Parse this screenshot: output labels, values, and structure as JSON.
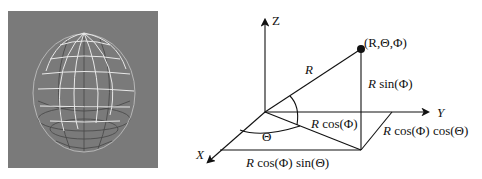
{
  "figure": {
    "left_panel": {
      "description": "wireframe sphere render on gray background",
      "background_color": "#7a7a7a",
      "latitude_lines": 7,
      "longitude_lines": 8
    },
    "right_panel": {
      "axes": {
        "z_label": "Z",
        "y_label": "Y",
        "x_label": "X"
      },
      "point_label": "(R,Θ,Φ)",
      "radius_label": "R",
      "height_label_r": "R",
      "height_label_rest": " sin(Φ)",
      "projection_label_r": "R",
      "projection_label_rest": " cos(Φ)",
      "y_component_label_r": "R",
      "y_component_label_rest": " cos(Φ) cos(Θ)",
      "x_component_label_r": "R",
      "x_component_label_rest": " cos(Φ) sin(Θ)",
      "theta_label": "Θ"
    }
  }
}
